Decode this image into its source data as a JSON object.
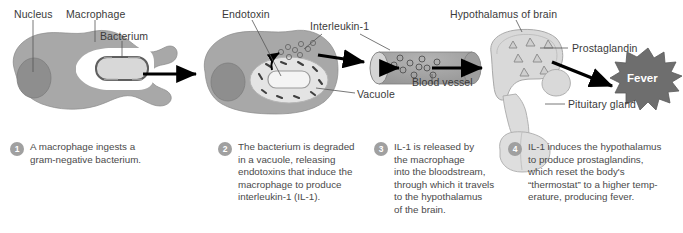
{
  "figure": {
    "background_color": "#ffffff"
  },
  "colors": {
    "cell_body": "#a8a8a8",
    "nucleus": "#8e8e8e",
    "vacuole_fill": "#e4e4e4",
    "bacterium_fill": "#d8d8d8",
    "vessel": "#9e9e9e",
    "vessel_cap": "#d5d5d5",
    "brain": "#d9d9d9",
    "fever_star": "#6e6e6e",
    "arrow": "#000000",
    "leader_line": "#555555",
    "label_text": "#3a3a3a",
    "caption_text": "#4a4a4a",
    "badge": "#a0a0a0",
    "badge_text": "#ffffff",
    "fever_text": "#ffffff"
  },
  "labels": [
    {
      "id": "nucleus",
      "text": "Nucleus",
      "x": 14,
      "y": 8
    },
    {
      "id": "macrophage",
      "text": "Macrophage",
      "x": 66,
      "y": 8
    },
    {
      "id": "bacterium",
      "text": "Bacterium",
      "x": 100,
      "y": 30
    },
    {
      "id": "endotoxin",
      "text": "Endotoxin",
      "x": 222,
      "y": 8
    },
    {
      "id": "interleukin-1",
      "text": "Interleukin-1",
      "x": 310,
      "y": 20
    },
    {
      "id": "vacuole",
      "text": "Vacuole",
      "x": 357,
      "y": 88
    },
    {
      "id": "blood-vessel",
      "text": "Blood\nvessel",
      "x": 412,
      "y": 76
    },
    {
      "id": "hypothalamus",
      "text": "Hypothalamus of brain",
      "x": 450,
      "y": 8
    },
    {
      "id": "prostaglandin",
      "text": "Prostaglandin",
      "x": 572,
      "y": 42
    },
    {
      "id": "pituitary",
      "text": "Pituitary\ngland",
      "x": 568,
      "y": 98
    }
  ],
  "fever": {
    "label": "Fever",
    "x": 614,
    "y": 78
  },
  "steps": [
    {
      "number": "1",
      "badge_x": 10,
      "badge_y": 142,
      "text_x": 30,
      "text_y": 141,
      "width": 170,
      "text": "A macrophage ingests a\ngram-negative bacterium."
    },
    {
      "number": "2",
      "badge_x": 218,
      "badge_y": 142,
      "text_x": 238,
      "text_y": 141,
      "width": 130,
      "text": "The bacterium is degraded\nin a vacuole, releasing\nendotoxins that induce the\nmacrophage to produce\ninterleukin-1 (IL-1)."
    },
    {
      "number": "3",
      "badge_x": 374,
      "badge_y": 142,
      "text_x": 394,
      "text_y": 141,
      "width": 120,
      "text": "IL-1 is released by\nthe macrophage\ninto the bloodstream,\nthrough which it travels\nto the hypothalamus\nof the brain."
    },
    {
      "number": "4",
      "badge_x": 508,
      "badge_y": 142,
      "text_x": 528,
      "text_y": 141,
      "width": 150,
      "text": "IL-1 induces the hypothalamus\nto produce prostaglandins,\nwhich reset the body's\n“thermostat” to a higher temp-\nerature, producing fever."
    }
  ],
  "structures": {
    "macrophage_1": "amoeboid gray cell engulfing bacterium",
    "macrophage_2": "amoeboid gray cell with vacuole and escaping endotoxin",
    "blood_vessel": "gray cylinder carrying interleukin-1 molecules",
    "hypothalamus": "light gray brain region with prostaglandin triangles",
    "pituitary_gland": "light gray lobed gland below hypothalamus",
    "fever_burst": "dark gray spiky starburst"
  }
}
